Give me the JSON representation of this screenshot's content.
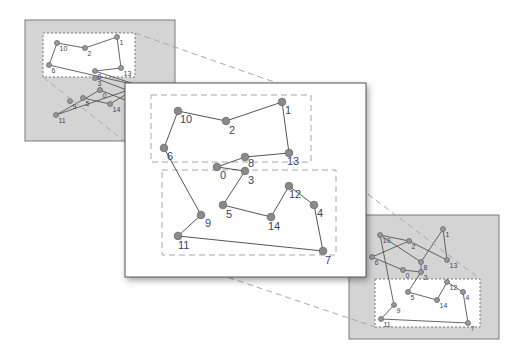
{
  "colors": {
    "background": "#ffffff",
    "panel_gray": "#d4d4d4",
    "panel_border": "#7a7a7a",
    "main_panel": "#ffffff",
    "main_border": "#555555",
    "edge": "#555555",
    "node_fill": "#8a8a8a",
    "node_stroke": "#6a6a6a",
    "label": "#3c3f6e",
    "dash": "#a8a8a8"
  },
  "panels": {
    "left": {
      "x": 25,
      "y": 20,
      "w": 150,
      "h": 121,
      "zoom_box": {
        "x": 43,
        "y": 33,
        "w": 92,
        "h": 44
      }
    },
    "main": {
      "x": 125,
      "y": 83,
      "w": 241,
      "h": 194,
      "upper_box": {
        "x": 151,
        "y": 95,
        "w": 160,
        "h": 67
      },
      "lower_box": {
        "x": 162,
        "y": 170,
        "w": 174,
        "h": 85
      }
    },
    "right": {
      "x": 349,
      "y": 215,
      "w": 150,
      "h": 124,
      "zoom_box": {
        "x": 375,
        "y": 279,
        "w": 105,
        "h": 48
      }
    }
  },
  "connectors": [
    {
      "x1": 135,
      "y1": 33,
      "x2": 311,
      "y2": 95
    },
    {
      "x1": 43,
      "y1": 77,
      "x2": 151,
      "y2": 162
    },
    {
      "x1": 336,
      "y1": 170,
      "x2": 480,
      "y2": 279
    },
    {
      "x1": 162,
      "y1": 255,
      "x2": 375,
      "y2": 327
    }
  ],
  "main_graph": {
    "nodes": [
      {
        "id": "0",
        "x": 217,
        "y": 167,
        "lx": 220,
        "ly": 179
      },
      {
        "id": "1",
        "x": 282,
        "y": 102,
        "lx": 285,
        "ly": 114
      },
      {
        "id": "2",
        "x": 226,
        "y": 121,
        "lx": 229,
        "ly": 134
      },
      {
        "id": "3",
        "x": 245,
        "y": 171,
        "lx": 248,
        "ly": 184
      },
      {
        "id": "4",
        "x": 314,
        "y": 205,
        "lx": 317,
        "ly": 217
      },
      {
        "id": "5",
        "x": 223,
        "y": 205,
        "lx": 226,
        "ly": 218
      },
      {
        "id": "6",
        "x": 164,
        "y": 148,
        "lx": 167,
        "ly": 160
      },
      {
        "id": "7",
        "x": 323,
        "y": 251,
        "lx": 325,
        "ly": 264
      },
      {
        "id": "8",
        "x": 245,
        "y": 157,
        "lx": 248,
        "ly": 167
      },
      {
        "id": "9",
        "x": 201,
        "y": 215,
        "lx": 205,
        "ly": 227
      },
      {
        "id": "10",
        "x": 178,
        "y": 111,
        "lx": 180,
        "ly": 123
      },
      {
        "id": "11",
        "x": 178,
        "y": 236,
        "lx": 178,
        "ly": 249
      },
      {
        "id": "12",
        "x": 289,
        "y": 186,
        "lx": 289,
        "ly": 198
      },
      {
        "id": "13",
        "x": 289,
        "y": 153,
        "lx": 287,
        "ly": 165
      },
      {
        "id": "14",
        "x": 271,
        "y": 217,
        "lx": 268,
        "ly": 230
      }
    ],
    "edges": [
      [
        "10",
        "2"
      ],
      [
        "2",
        "1"
      ],
      [
        "1",
        "13"
      ],
      [
        "13",
        "8"
      ],
      [
        "8",
        "0"
      ],
      [
        "0",
        "3"
      ],
      [
        "3",
        "5"
      ],
      [
        "5",
        "14"
      ],
      [
        "14",
        "12"
      ],
      [
        "12",
        "4"
      ],
      [
        "4",
        "7"
      ],
      [
        "7",
        "11"
      ],
      [
        "11",
        "9"
      ],
      [
        "9",
        "6"
      ],
      [
        "6",
        "10"
      ]
    ]
  },
  "left_graph": {
    "nodes": [
      {
        "id": "10",
        "x": 57,
        "y": 43
      },
      {
        "id": "2",
        "x": 85,
        "y": 48
      },
      {
        "id": "1",
        "x": 117,
        "y": 37
      },
      {
        "id": "13",
        "x": 121,
        "y": 68
      },
      {
        "id": "6",
        "x": 49,
        "y": 65
      },
      {
        "id": "8",
        "x": 95,
        "y": 71
      },
      {
        "id": "0",
        "x": 100,
        "y": 90
      },
      {
        "id": "3",
        "x": 95,
        "y": 78
      },
      {
        "id": "4",
        "x": 140,
        "y": 86
      },
      {
        "id": "5",
        "x": 83,
        "y": 98
      },
      {
        "id": "9",
        "x": 70,
        "y": 101
      },
      {
        "id": "14",
        "x": 110,
        "y": 104
      },
      {
        "id": "11",
        "x": 56,
        "y": 115
      },
      {
        "id": "12",
        "x": 140,
        "y": 95
      },
      {
        "id": "7",
        "x": 150,
        "y": 110
      }
    ],
    "edges": [
      [
        "10",
        "2"
      ],
      [
        "2",
        "1"
      ],
      [
        "1",
        "13"
      ],
      [
        "13",
        "8"
      ],
      [
        "10",
        "6"
      ],
      [
        "6",
        "4"
      ],
      [
        "8",
        "4"
      ],
      [
        "0",
        "11"
      ],
      [
        "11",
        "4"
      ],
      [
        "0",
        "7"
      ],
      [
        "5",
        "14"
      ],
      [
        "14",
        "4"
      ],
      [
        "3",
        "12"
      ]
    ]
  },
  "right_graph": {
    "nodes": [
      {
        "id": "10",
        "x": 380,
        "y": 235
      },
      {
        "id": "2",
        "x": 409,
        "y": 241
      },
      {
        "id": "1",
        "x": 443,
        "y": 229
      },
      {
        "id": "13",
        "x": 447,
        "y": 260
      },
      {
        "id": "6",
        "x": 372,
        "y": 257
      },
      {
        "id": "8",
        "x": 421,
        "y": 262
      },
      {
        "id": "0",
        "x": 403,
        "y": 270
      },
      {
        "id": "3",
        "x": 421,
        "y": 272
      },
      {
        "id": "5",
        "x": 408,
        "y": 292
      },
      {
        "id": "9",
        "x": 394,
        "y": 305
      },
      {
        "id": "11",
        "x": 381,
        "y": 319
      },
      {
        "id": "14",
        "x": 437,
        "y": 300
      },
      {
        "id": "12",
        "x": 447,
        "y": 282
      },
      {
        "id": "4",
        "x": 463,
        "y": 292
      },
      {
        "id": "7",
        "x": 468,
        "y": 323
      }
    ],
    "edges": [
      [
        "10",
        "2"
      ],
      [
        "2",
        "13"
      ],
      [
        "1",
        "13"
      ],
      [
        "1",
        "8"
      ],
      [
        "10",
        "8"
      ],
      [
        "6",
        "2"
      ],
      [
        "6",
        "0"
      ],
      [
        "0",
        "3"
      ],
      [
        "3",
        "8"
      ],
      [
        "3",
        "5"
      ],
      [
        "5",
        "14"
      ],
      [
        "14",
        "12"
      ],
      [
        "12",
        "4"
      ],
      [
        "4",
        "7"
      ],
      [
        "7",
        "11"
      ],
      [
        "11",
        "9"
      ],
      [
        "9",
        "10"
      ]
    ]
  }
}
